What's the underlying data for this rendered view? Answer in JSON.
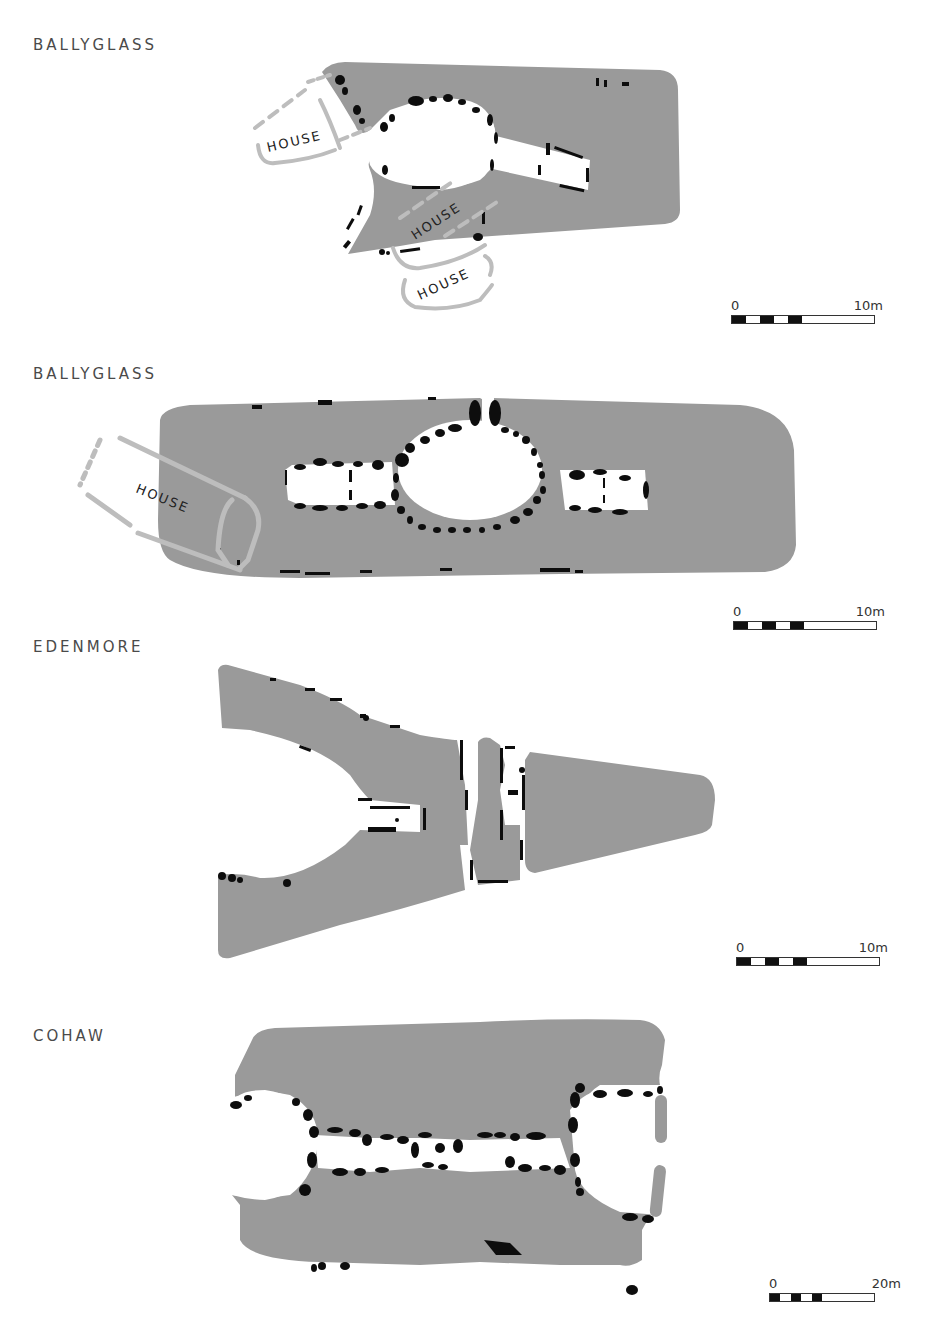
{
  "figure": {
    "colors": {
      "cairn": "#9a9a9a",
      "stone": "#0d0d0d",
      "house_wall": "#bdbdbd",
      "background": "#ffffff",
      "label": "#4a4a4a"
    },
    "plans": [
      {
        "id": "ballyglass-1",
        "title": "BALLYGLASS",
        "annotations": [
          "HOUSE",
          "HOUSE",
          "HOUSE"
        ],
        "scale": {
          "start": "0",
          "end": "10m"
        }
      },
      {
        "id": "ballyglass-2",
        "title": "BALLYGLASS",
        "annotations": [
          "HOUSE"
        ],
        "scale": {
          "start": "0",
          "end": "10m"
        }
      },
      {
        "id": "edenmore",
        "title": "EDENMORE",
        "annotations": [],
        "scale": {
          "start": "0",
          "end": "10m"
        }
      },
      {
        "id": "cohaw",
        "title": "COHAW",
        "annotations": [],
        "scale": {
          "start": "0",
          "end": "20m"
        }
      }
    ]
  }
}
